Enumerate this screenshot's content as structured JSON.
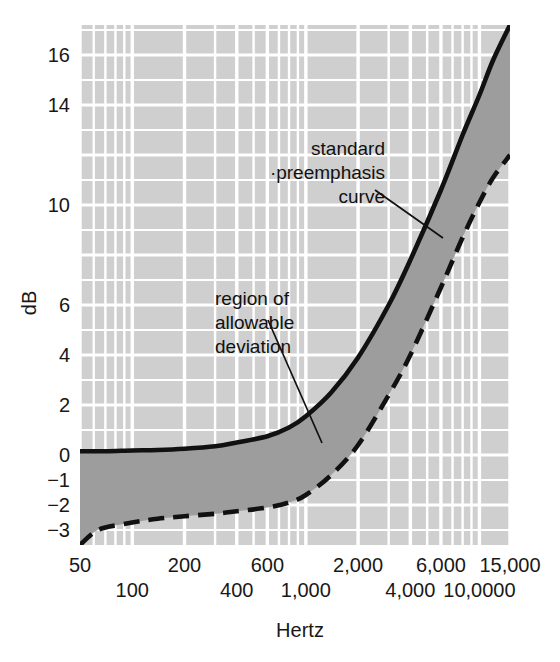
{
  "chart_data": {
    "type": "line",
    "title": "",
    "xlabel": "Hertz",
    "ylabel": "dB",
    "xscale": "log",
    "xlim": [
      50,
      15000
    ],
    "ylim": [
      -3.6,
      17.2
    ],
    "grid": true,
    "grid_color": "#ffffff",
    "plot_bg_color": "#cfcfcf",
    "band_fill_color": "#9d9d9d",
    "curve_color": "#111111",
    "legend": "none",
    "ytick_labels": [
      "16",
      "14",
      "10",
      "6",
      "4",
      "2",
      "0",
      "−1",
      "−2",
      "−3"
    ],
    "ytick_values": [
      16,
      14,
      10,
      6,
      4,
      2,
      0,
      -1,
      -2,
      -3
    ],
    "xtick_labels_upper": [
      "50",
      "200",
      "600",
      "2,000",
      "6,000",
      "15,000"
    ],
    "xtick_values_upper": [
      50,
      200,
      600,
      2000,
      6000,
      15000
    ],
    "xtick_labels_lower": [
      "100",
      "400",
      "1,000",
      "4,000",
      "10,0000"
    ],
    "xtick_values_lower": [
      100,
      400,
      1000,
      4000,
      10000
    ],
    "series": [
      {
        "name": "standard preemphasis curve",
        "style": "solid",
        "points": [
          [
            50,
            0.15
          ],
          [
            70,
            0.15
          ],
          [
            100,
            0.18
          ],
          [
            140,
            0.2
          ],
          [
            200,
            0.25
          ],
          [
            300,
            0.35
          ],
          [
            400,
            0.5
          ],
          [
            600,
            0.75
          ],
          [
            800,
            1.1
          ],
          [
            1000,
            1.55
          ],
          [
            1400,
            2.5
          ],
          [
            2000,
            3.9
          ],
          [
            3000,
            6.0
          ],
          [
            4000,
            7.8
          ],
          [
            6000,
            10.6
          ],
          [
            8000,
            12.8
          ],
          [
            10000,
            14.4
          ],
          [
            12000,
            15.8
          ],
          [
            15000,
            17.2
          ]
        ]
      },
      {
        "name": "lower tolerance limit",
        "style": "dashed",
        "points": [
          [
            50,
            -3.6
          ],
          [
            60,
            -3.1
          ],
          [
            70,
            -2.9
          ],
          [
            100,
            -2.7
          ],
          [
            140,
            -2.55
          ],
          [
            200,
            -2.45
          ],
          [
            300,
            -2.35
          ],
          [
            400,
            -2.25
          ],
          [
            600,
            -2.1
          ],
          [
            800,
            -1.9
          ],
          [
            1000,
            -1.6
          ],
          [
            1400,
            -0.8
          ],
          [
            2000,
            0.4
          ],
          [
            3000,
            2.4
          ],
          [
            4000,
            4.0
          ],
          [
            6000,
            6.7
          ],
          [
            8000,
            8.7
          ],
          [
            10000,
            10.1
          ],
          [
            12000,
            11.1
          ],
          [
            15000,
            12.0
          ]
        ]
      }
    ],
    "annotations": [
      {
        "id": "standard-preemphasis-curve-label",
        "lines": [
          "standard",
          "·preemphasis",
          "curve"
        ],
        "text_anchor": "end",
        "text_x": 385,
        "text_y": 155,
        "line_height": 24,
        "leader_from": [
          375,
          190
        ],
        "leader_to": [
          443,
          238
        ]
      },
      {
        "id": "region-of-allowable-deviation-label",
        "lines": [
          "region of",
          "allowable",
          "deviation"
        ],
        "text_anchor": "start",
        "text_x": 215,
        "text_y": 305,
        "line_height": 24,
        "leader_from": [
          268,
          320
        ],
        "leader_to": [
          322,
          443
        ]
      }
    ]
  },
  "plot": {
    "left": 80,
    "right": 510,
    "top": 25,
    "bottom": 545
  },
  "axis": {
    "ylabel": "dB",
    "ylabel_x": 36,
    "ylabel_y": 303,
    "xlabel": "Hertz",
    "xlabel_x": 300,
    "xlabel_y": 637
  }
}
